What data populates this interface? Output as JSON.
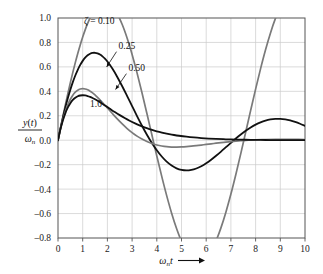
{
  "chart_data": {
    "type": "line",
    "title": "",
    "xlabel": "ωₙt",
    "ylabel": "y(t)/ωₙ",
    "xlabel_parts": {
      "omega": "ω",
      "sub_n": "n",
      "t": "t",
      "arrow": "⟶"
    },
    "ylabel_parts": {
      "numerator": "y(t)",
      "denominator": "ωₙ",
      "den_omega": "ω",
      "den_sub": "n"
    },
    "xlim": [
      0,
      10
    ],
    "ylim": [
      -0.8,
      1.0
    ],
    "xticks": [
      0,
      1,
      2,
      3,
      4,
      5,
      6,
      7,
      8,
      9,
      10
    ],
    "xtick_labels": [
      "0",
      "1",
      "2",
      "3",
      "4",
      "5",
      "6",
      "7",
      "8",
      "9",
      "10"
    ],
    "yticks": [
      1.0,
      0.8,
      0.6,
      0.4,
      0.2,
      0.0,
      -0.2,
      -0.4,
      -0.6,
      -0.8
    ],
    "ytick_labels": [
      "1.0",
      "0.8",
      "0.6",
      "0.4",
      "0.2",
      "0.0",
      "–0.2",
      "–0.4",
      "–0.6",
      "–0.8"
    ],
    "grid": true,
    "grid_color": "#cccccc",
    "frame_color": "#555555",
    "legend": "inline-annotations",
    "zeta_symbol": "ζ",
    "zeta_equals_label": "ζ = 0.10",
    "annotations": [
      {
        "text": "ζ = 0.10",
        "x": 1.05,
        "y": 0.955,
        "arrow": false
      },
      {
        "text": "0.25",
        "x": 2.45,
        "y": 0.745,
        "arrow": true,
        "arrow_to_x": 1.97,
        "arrow_to_y": 0.6
      },
      {
        "text": "0.50",
        "x": 2.85,
        "y": 0.565,
        "arrow": true,
        "arrow_to_x": 2.33,
        "arrow_to_y": 0.415
      },
      {
        "text": "1.0",
        "x": 1.3,
        "y": 0.27,
        "arrow": false
      }
    ],
    "series": [
      {
        "name": "ζ = 0.10",
        "zeta": 0.1,
        "color": "#7a7a7a",
        "width": 1.7,
        "peak1": {
          "x": 1.45,
          "y": 0.875
        },
        "trough1": {
          "x": 4.65,
          "y": -0.655
        },
        "peak2": {
          "x": 7.8,
          "y": 0.43
        },
        "end": {
          "x": 10,
          "y": -0.155
        },
        "points": [
          [
            0,
            0
          ],
          [
            0.1,
            0.0994
          ],
          [
            0.2,
            0.1965
          ],
          [
            0.3,
            0.2911
          ],
          [
            0.4,
            0.3827
          ],
          [
            0.5,
            0.4708
          ],
          [
            0.6,
            0.5549
          ],
          [
            0.7,
            0.6348
          ],
          [
            0.8,
            0.7099
          ],
          [
            0.9,
            0.7799
          ],
          [
            1.0,
            0.8444
          ],
          [
            1.1,
            0.9031
          ],
          [
            1.2,
            0.9557
          ],
          [
            1.3,
            1.0018
          ],
          [
            1.35,
            1.0223
          ],
          [
            1.4,
            1.0412
          ],
          [
            1.5,
            1.0735
          ],
          [
            1.6,
            1.0987
          ],
          [
            1.7,
            1.1166
          ],
          [
            1.8,
            1.1271
          ],
          [
            1.9,
            1.1301
          ],
          [
            2.0,
            1.1255
          ],
          [
            2.1,
            1.1135
          ],
          [
            2.2,
            1.0941
          ],
          [
            2.3,
            1.0675
          ],
          [
            2.4,
            1.0338
          ],
          [
            2.5,
            0.9934
          ],
          [
            2.6,
            0.9465
          ],
          [
            2.7,
            0.8935
          ],
          [
            2.8,
            0.8347
          ],
          [
            2.9,
            0.7706
          ],
          [
            3.0,
            0.7017
          ],
          [
            3.2,
            0.5513
          ],
          [
            3.4,
            0.3887
          ],
          [
            3.6,
            0.2182
          ],
          [
            3.8,
            0.0443
          ],
          [
            4.0,
            -0.1286
          ],
          [
            4.2,
            -0.2959
          ],
          [
            4.4,
            -0.4534
          ],
          [
            4.6,
            -0.5969
          ],
          [
            4.8,
            -0.7227
          ],
          [
            5.0,
            -0.8275
          ],
          [
            5.2,
            -0.9085
          ],
          [
            5.4,
            -0.9635
          ],
          [
            5.6,
            -0.9911
          ],
          [
            5.8,
            -0.9904
          ],
          [
            6.0,
            -0.9614
          ],
          [
            6.2,
            -0.9048
          ],
          [
            6.4,
            -0.822
          ],
          [
            6.6,
            -0.7151
          ],
          [
            6.8,
            -0.5869
          ],
          [
            7.0,
            -0.4406
          ],
          [
            7.2,
            -0.28
          ],
          [
            7.4,
            -0.1094
          ],
          [
            7.6,
            0.0669
          ],
          [
            7.8,
            0.2442
          ],
          [
            8.0,
            0.4181
          ],
          [
            8.2,
            0.5841
          ],
          [
            8.4,
            0.7381
          ],
          [
            8.6,
            0.876
          ],
          [
            8.8,
            0.9945
          ],
          [
            9.0,
            1.0905
          ],
          [
            9.2,
            1.1617
          ],
          [
            9.4,
            1.2064
          ],
          [
            9.6,
            1.2236
          ],
          [
            9.8,
            1.2129
          ],
          [
            10.0,
            1.1748
          ]
        ]
      },
      {
        "name": "ζ = 0.25",
        "zeta": 0.25,
        "color": "#111111",
        "width": 1.8,
        "peak1": {
          "x": 1.42,
          "y": 0.7
        },
        "trough1": {
          "x": 4.6,
          "y": -0.335
        },
        "peak2": {
          "x": 7.9,
          "y": 0.105
        },
        "end": {
          "x": 10,
          "y": -0.02
        },
        "points": [
          [
            0,
            0
          ],
          [
            0.1,
            0.0966
          ],
          [
            0.2,
            0.1864
          ],
          [
            0.3,
            0.2693
          ],
          [
            0.4,
            0.3451
          ],
          [
            0.5,
            0.4137
          ],
          [
            0.6,
            0.4751
          ],
          [
            0.7,
            0.5293
          ],
          [
            0.8,
            0.5764
          ],
          [
            0.9,
            0.6163
          ],
          [
            1.0,
            0.6492
          ],
          [
            1.1,
            0.6753
          ],
          [
            1.2,
            0.6947
          ],
          [
            1.3,
            0.7077
          ],
          [
            1.4,
            0.7145
          ],
          [
            1.5,
            0.7154
          ],
          [
            1.6,
            0.7108
          ],
          [
            1.7,
            0.7009
          ],
          [
            1.8,
            0.6861
          ],
          [
            1.9,
            0.6669
          ],
          [
            2.0,
            0.6435
          ],
          [
            2.2,
            0.5861
          ],
          [
            2.4,
            0.5178
          ],
          [
            2.6,
            0.4418
          ],
          [
            2.8,
            0.3612
          ],
          [
            3.0,
            0.2789
          ],
          [
            3.2,
            0.1973
          ],
          [
            3.4,
            0.1187
          ],
          [
            3.6,
            0.045
          ],
          [
            3.8,
            -0.0223
          ],
          [
            4.0,
            -0.082
          ],
          [
            4.2,
            -0.1331
          ],
          [
            4.4,
            -0.175
          ],
          [
            4.6,
            -0.2073
          ],
          [
            4.8,
            -0.23
          ],
          [
            5.0,
            -0.2432
          ],
          [
            5.2,
            -0.2474
          ],
          [
            5.4,
            -0.2431
          ],
          [
            5.6,
            -0.2313
          ],
          [
            5.8,
            -0.2127
          ],
          [
            6.0,
            -0.1885
          ],
          [
            6.2,
            -0.1597
          ],
          [
            6.4,
            -0.1274
          ],
          [
            6.6,
            -0.0928
          ],
          [
            6.8,
            -0.0571
          ],
          [
            7.0,
            -0.0212
          ],
          [
            7.2,
            0.0138
          ],
          [
            7.4,
            0.0469
          ],
          [
            7.6,
            0.0774
          ],
          [
            7.8,
            0.1045
          ],
          [
            8.0,
            0.1277
          ],
          [
            8.2,
            0.1464
          ],
          [
            8.4,
            0.1605
          ],
          [
            8.6,
            0.1698
          ],
          [
            8.8,
            0.1743
          ],
          [
            9.0,
            0.1743
          ],
          [
            9.2,
            0.1699
          ],
          [
            9.4,
            0.1616
          ],
          [
            9.6,
            0.1497
          ],
          [
            9.8,
            0.1348
          ],
          [
            10.0,
            0.1174
          ]
        ]
      },
      {
        "name": "ζ = 0.50",
        "zeta": 0.5,
        "color": "#7a7a7a",
        "width": 1.7,
        "peak1": {
          "x": 1.2,
          "y": 0.535
        },
        "trough1": {
          "x": 4.35,
          "y": -0.105
        },
        "peak2": {
          "x": 7.9,
          "y": 0.022
        },
        "end": {
          "x": 10,
          "y": 0.0
        },
        "points": [
          [
            0,
            0
          ],
          [
            0.1,
            0.0928
          ],
          [
            0.2,
            0.1718
          ],
          [
            0.3,
            0.2379
          ],
          [
            0.4,
            0.2921
          ],
          [
            0.5,
            0.3354
          ],
          [
            0.6,
            0.3687
          ],
          [
            0.7,
            0.3931
          ],
          [
            0.8,
            0.4095
          ],
          [
            0.9,
            0.4187
          ],
          [
            1.0,
            0.4218
          ],
          [
            1.1,
            0.4194
          ],
          [
            1.2,
            0.4124
          ],
          [
            1.3,
            0.4014
          ],
          [
            1.4,
            0.3872
          ],
          [
            1.5,
            0.3703
          ],
          [
            1.6,
            0.3513
          ],
          [
            1.8,
            0.3089
          ],
          [
            2.0,
            0.2637
          ],
          [
            2.2,
            0.2183
          ],
          [
            2.4,
            0.1743
          ],
          [
            2.6,
            0.1331
          ],
          [
            2.8,
            0.0956
          ],
          [
            3.0,
            0.0623
          ],
          [
            3.2,
            0.0334
          ],
          [
            3.4,
            0.009
          ],
          [
            3.6,
            -0.011
          ],
          [
            3.8,
            -0.0269
          ],
          [
            4.0,
            -0.0389
          ],
          [
            4.2,
            -0.0474
          ],
          [
            4.4,
            -0.0529
          ],
          [
            4.6,
            -0.0557
          ],
          [
            4.8,
            -0.0563
          ],
          [
            5.0,
            -0.0551
          ],
          [
            5.2,
            -0.0525
          ],
          [
            5.4,
            -0.0489
          ],
          [
            5.6,
            -0.0445
          ],
          [
            5.8,
            -0.0396
          ],
          [
            6.0,
            -0.0345
          ],
          [
            6.2,
            -0.0294
          ],
          [
            6.4,
            -0.0244
          ],
          [
            6.6,
            -0.0196
          ],
          [
            6.8,
            -0.0152
          ],
          [
            7.0,
            -0.0112
          ],
          [
            7.2,
            -0.0076
          ],
          [
            7.4,
            -0.0044
          ],
          [
            7.6,
            -0.0017
          ],
          [
            7.8,
            0.0006
          ],
          [
            8.0,
            0.0025
          ],
          [
            8.4,
            0.0052
          ],
          [
            8.8,
            0.0066
          ],
          [
            9.2,
            0.007
          ],
          [
            9.6,
            0.0067
          ],
          [
            10.0,
            0.006
          ]
        ]
      },
      {
        "name": "ζ = 1.0",
        "zeta": 1.0,
        "color": "#111111",
        "width": 1.8,
        "peak1": {
          "x": 1.0,
          "y": 0.372
        },
        "trough1": null,
        "peak2": null,
        "end": {
          "x": 10,
          "y": 0.0
        },
        "points": [
          [
            0,
            0
          ],
          [
            0.1,
            0.0905
          ],
          [
            0.2,
            0.1637
          ],
          [
            0.3,
            0.2222
          ],
          [
            0.4,
            0.2681
          ],
          [
            0.5,
            0.3033
          ],
          [
            0.6,
            0.3293
          ],
          [
            0.7,
            0.3476
          ],
          [
            0.8,
            0.3595
          ],
          [
            0.9,
            0.3659
          ],
          [
            1.0,
            0.3679
          ],
          [
            1.1,
            0.3662
          ],
          [
            1.2,
            0.3614
          ],
          [
            1.3,
            0.3543
          ],
          [
            1.4,
            0.3452
          ],
          [
            1.5,
            0.3347
          ],
          [
            1.7,
            0.3106
          ],
          [
            1.9,
            0.2842
          ],
          [
            2.1,
            0.2572
          ],
          [
            2.3,
            0.2306
          ],
          [
            2.5,
            0.2052
          ],
          [
            2.7,
            0.1815
          ],
          [
            2.9,
            0.1596
          ],
          [
            3.1,
            0.1397
          ],
          [
            3.3,
            0.1217
          ],
          [
            3.5,
            0.1057
          ],
          [
            3.7,
            0.0915
          ],
          [
            3.9,
            0.0789
          ],
          [
            4.1,
            0.0679
          ],
          [
            4.3,
            0.0582
          ],
          [
            4.5,
            0.05
          ],
          [
            4.7,
            0.0427
          ],
          [
            4.9,
            0.0365
          ],
          [
            5.2,
            0.0287
          ],
          [
            5.5,
            0.0225
          ],
          [
            5.8,
            0.0176
          ],
          [
            6.1,
            0.0137
          ],
          [
            6.4,
            0.0106
          ],
          [
            6.7,
            0.0082
          ],
          [
            7.0,
            0.0064
          ],
          [
            7.4,
            0.0045
          ],
          [
            7.8,
            0.0032
          ],
          [
            8.2,
            0.0022
          ],
          [
            8.6,
            0.0016
          ],
          [
            9.0,
            0.0011
          ],
          [
            9.4,
            0.0008
          ],
          [
            10.0,
            0.0005
          ]
        ]
      }
    ]
  }
}
